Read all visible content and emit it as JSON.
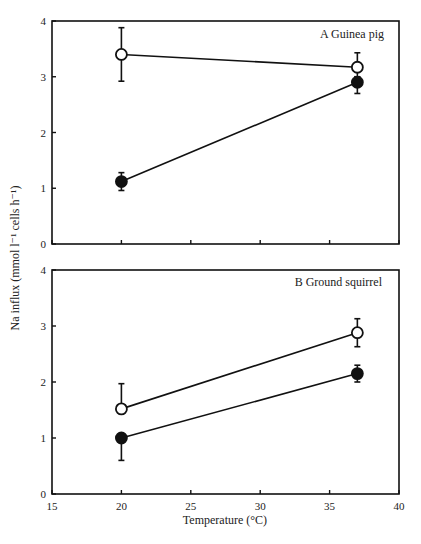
{
  "chart_data": [
    {
      "type": "line",
      "panel": "A",
      "title": "A   Guinea pig",
      "xlabel": "",
      "ylabel": "Na influx (mmol l⁻¹ cells h⁻¹)",
      "xlim": [
        15,
        40
      ],
      "ylim": [
        0,
        4
      ],
      "xticks": [
        15,
        20,
        25,
        30,
        35,
        40
      ],
      "xtick_labels_shown": false,
      "yticks": [
        0,
        1,
        2,
        3,
        4
      ],
      "ytick_labels": [
        "0",
        "1",
        "2",
        "3",
        "4"
      ],
      "grid": false,
      "x": [
        20,
        37
      ],
      "series": [
        {
          "name": "open circles",
          "marker": "open-circle",
          "values": [
            3.4,
            3.17
          ],
          "err_low": [
            2.92,
            3.0
          ],
          "err_high": [
            3.88,
            3.43
          ]
        },
        {
          "name": "filled circles",
          "marker": "filled-circle",
          "values": [
            1.12,
            2.9
          ],
          "err_low": [
            0.96,
            2.7
          ],
          "err_high": [
            1.28,
            3.0
          ]
        }
      ]
    },
    {
      "type": "line",
      "panel": "B",
      "title": "B   Ground squirrel",
      "xlabel": "Temperature (°C)",
      "ylabel": "Na influx (mmol l⁻¹ cells h⁻¹)",
      "xlim": [
        15,
        40
      ],
      "ylim": [
        0,
        4
      ],
      "xticks": [
        15,
        20,
        25,
        30,
        35,
        40
      ],
      "xtick_labels": [
        "15",
        "20",
        "25",
        "30",
        "35",
        "40"
      ],
      "yticks": [
        0,
        1,
        2,
        3,
        4
      ],
      "ytick_labels": [
        "0",
        "1",
        "2",
        "3",
        "4"
      ],
      "grid": false,
      "x": [
        20,
        37
      ],
      "series": [
        {
          "name": "open circles",
          "marker": "open-circle",
          "values": [
            1.52,
            2.88
          ],
          "err_low": [
            1.52,
            2.63
          ],
          "err_high": [
            1.97,
            3.13
          ]
        },
        {
          "name": "filled circles",
          "marker": "filled-circle",
          "values": [
            1.0,
            2.15
          ],
          "err_low": [
            0.6,
            2.0
          ],
          "err_high": [
            1.0,
            2.3
          ]
        }
      ]
    }
  ],
  "labels": {
    "panel_a_title": "A   Guinea pig",
    "panel_b_title": "B   Ground squirrel",
    "x_axis_label": "Temperature (°C)",
    "y_axis_label": "Na influx (mmol l⁻¹ cells h⁻¹)"
  },
  "colors": {
    "axis": "#111111",
    "line": "#111111",
    "marker_fill": "#111111",
    "open_marker_fill": "#ffffff"
  }
}
